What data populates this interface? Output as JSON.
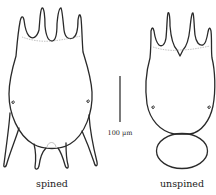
{
  "figure": {
    "type": "scientific illustration",
    "specimens": [
      {
        "id": "spined",
        "label": "spined"
      },
      {
        "id": "unspined",
        "label": "unspined"
      }
    ],
    "scale_bar": {
      "label": "100 µm"
    },
    "colors": {
      "line": "#2a2a2a",
      "background": "#ffffff",
      "faint_line": "#9a9a9a"
    }
  }
}
